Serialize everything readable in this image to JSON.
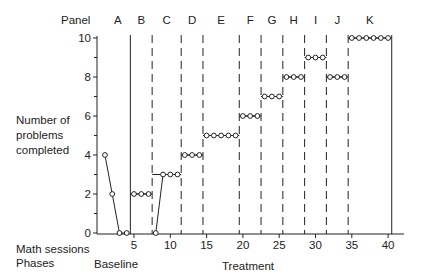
{
  "labels": {
    "panel": "Panel",
    "ylabel_lines": [
      "Number of",
      "problems",
      "completed"
    ],
    "xlabel": "Math sessions",
    "phases_label": "Phases",
    "phase_baseline": "Baseline",
    "phase_treatment": "Treatment"
  },
  "chart_data": {
    "type": "line",
    "title": "",
    "xlabel": "Math sessions",
    "ylabel": "Number of problems completed",
    "xlim": [
      0,
      42
    ],
    "ylim": [
      0,
      10
    ],
    "x_ticks": [
      5,
      10,
      15,
      20,
      25,
      30,
      35,
      40
    ],
    "y_ticks": [
      0,
      2,
      4,
      6,
      8,
      10
    ],
    "y_minor_ticks": [
      1,
      3,
      5,
      7,
      9
    ],
    "grid": false,
    "legend": null,
    "marker": "open-circle",
    "phases": [
      {
        "name": "Baseline",
        "sessions": [
          1,
          4
        ]
      },
      {
        "name": "Treatment",
        "sessions": [
          5,
          40
        ]
      }
    ],
    "phase_change_lines": [
      {
        "x": 4.5,
        "style": "solid"
      },
      {
        "x": 7.5,
        "style": "dashed"
      },
      {
        "x": 11.5,
        "style": "dashed"
      },
      {
        "x": 14.5,
        "style": "dashed"
      },
      {
        "x": 19.5,
        "style": "dashed"
      },
      {
        "x": 22.5,
        "style": "dashed"
      },
      {
        "x": 25.5,
        "style": "dashed"
      },
      {
        "x": 28.5,
        "style": "dashed"
      },
      {
        "x": 31.5,
        "style": "dashed"
      },
      {
        "x": 34.5,
        "style": "dashed"
      },
      {
        "x": 40.5,
        "style": "solid"
      }
    ],
    "panels": [
      {
        "label": "A",
        "phase": "Baseline",
        "criterion": null,
        "x": [
          1,
          2,
          3,
          4
        ],
        "values": [
          4,
          2,
          0,
          0
        ]
      },
      {
        "label": "B",
        "phase": "Treatment",
        "criterion": 2,
        "x": [
          5,
          6,
          7
        ],
        "values": [
          2,
          2,
          2
        ]
      },
      {
        "label": "C",
        "phase": "Treatment",
        "criterion": 3,
        "x": [
          8,
          9,
          10,
          11
        ],
        "values": [
          0,
          3,
          3,
          3
        ]
      },
      {
        "label": "D",
        "phase": "Treatment",
        "criterion": 4,
        "x": [
          12,
          13,
          14
        ],
        "values": [
          4,
          4,
          4
        ]
      },
      {
        "label": "E",
        "phase": "Treatment",
        "criterion": 5,
        "x": [
          15,
          16,
          17,
          18,
          19
        ],
        "values": [
          5,
          5,
          5,
          5,
          5
        ]
      },
      {
        "label": "F",
        "phase": "Treatment",
        "criterion": 6,
        "x": [
          20,
          21,
          22
        ],
        "values": [
          6,
          6,
          6
        ]
      },
      {
        "label": "G",
        "phase": "Treatment",
        "criterion": 7,
        "x": [
          23,
          24,
          25
        ],
        "values": [
          7,
          7,
          7
        ]
      },
      {
        "label": "H",
        "phase": "Treatment",
        "criterion": 8,
        "x": [
          26,
          27,
          28
        ],
        "values": [
          8,
          8,
          8
        ]
      },
      {
        "label": "I",
        "phase": "Treatment",
        "criterion": 9,
        "x": [
          29,
          30,
          31
        ],
        "values": [
          9,
          9,
          9
        ]
      },
      {
        "label": "J",
        "phase": "Treatment",
        "criterion": 8,
        "x": [
          32,
          33,
          34
        ],
        "values": [
          8,
          8,
          8
        ]
      },
      {
        "label": "K",
        "phase": "Treatment",
        "criterion": 10,
        "x": [
          35,
          36,
          37,
          38,
          39,
          40
        ],
        "values": [
          10,
          10,
          10,
          10,
          10,
          10
        ]
      }
    ],
    "colors": {
      "ink": "#222222",
      "background": "#ffffff"
    }
  }
}
